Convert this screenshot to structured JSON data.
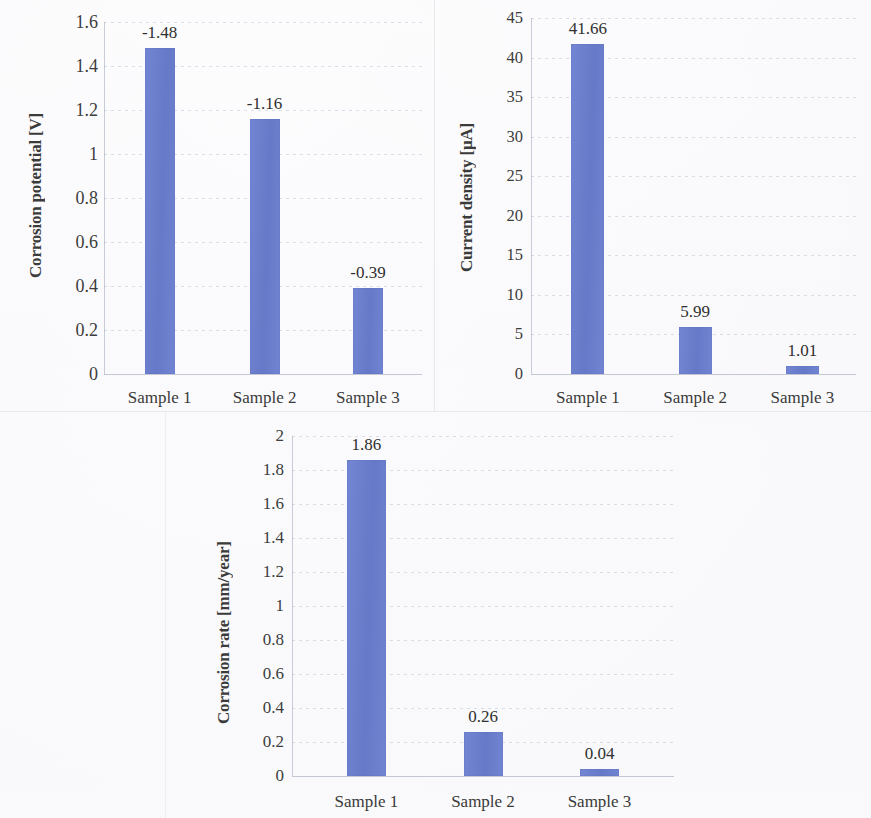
{
  "figure": {
    "charts": [
      {
        "id": "corrosion-potential",
        "ylabel": "Corrosion potential [V]",
        "categories": [
          "Sample 1",
          "Sample 2",
          "Sample 3"
        ],
        "bar_labels": [
          "-1.48",
          "-1.16",
          "-0.39"
        ],
        "tick_labels": [
          "1.6",
          "1.4",
          "1.2",
          "1",
          "0.8",
          "0.6",
          "0.4",
          "0.2",
          "0"
        ]
      },
      {
        "id": "current-density",
        "ylabel": "Current density [µA]",
        "categories": [
          "Sample 1",
          "Sample 2",
          "Sample 3"
        ],
        "bar_labels": [
          "41.66",
          "5.99",
          "1.01"
        ],
        "tick_labels": [
          "45",
          "40",
          "35",
          "30",
          "25",
          "20",
          "15",
          "10",
          "5",
          "0"
        ]
      },
      {
        "id": "corrosion-rate",
        "ylabel": "Corrosion rate [mm/year]",
        "categories": [
          "Sample 1",
          "Sample 2",
          "Sample 3"
        ],
        "bar_labels": [
          "1.86",
          "0.26",
          "0.04"
        ],
        "tick_labels": [
          "2",
          "1.8",
          "1.6",
          "1.4",
          "1.2",
          "1",
          "0.8",
          "0.6",
          "0.4",
          "0.2",
          "0"
        ]
      }
    ]
  },
  "colors": {
    "bar_fill": "#6a7ed0",
    "gridline": "#a8b0c4",
    "text": "#3a3a3a",
    "frame": "#e9e9ec"
  },
  "chart_data": [
    {
      "type": "bar",
      "title": "",
      "xlabel": "",
      "ylabel": "Corrosion potential [V]",
      "categories": [
        "Sample 1",
        "Sample 2",
        "Sample 3"
      ],
      "values": [
        1.48,
        1.16,
        0.39
      ],
      "data_labels": [
        "-1.48",
        "-1.16",
        "-0.39"
      ],
      "true_values": [
        -1.48,
        -1.16,
        -0.39
      ],
      "ylim": [
        0,
        1.6
      ],
      "ytick_step": 0.2,
      "yticks": [
        0,
        0.2,
        0.4,
        0.6,
        0.8,
        1,
        1.2,
        1.4,
        1.6
      ],
      "grid": true,
      "legend": false
    },
    {
      "type": "bar",
      "title": "",
      "xlabel": "",
      "ylabel": "Current density [µA]",
      "categories": [
        "Sample 1",
        "Sample 2",
        "Sample 3"
      ],
      "values": [
        41.66,
        5.99,
        1.01
      ],
      "data_labels": [
        "41.66",
        "5.99",
        "1.01"
      ],
      "ylim": [
        0,
        45
      ],
      "ytick_step": 5,
      "yticks": [
        0,
        5,
        10,
        15,
        20,
        25,
        30,
        35,
        40,
        45
      ],
      "grid": true,
      "legend": false
    },
    {
      "type": "bar",
      "title": "",
      "xlabel": "",
      "ylabel": "Corrosion rate [mm/year]",
      "categories": [
        "Sample 1",
        "Sample 2",
        "Sample 3"
      ],
      "values": [
        1.86,
        0.26,
        0.04
      ],
      "data_labels": [
        "1.86",
        "0.26",
        "0.04"
      ],
      "ylim": [
        0,
        2
      ],
      "ytick_step": 0.2,
      "yticks": [
        0,
        0.2,
        0.4,
        0.6,
        0.8,
        1,
        1.2,
        1.4,
        1.6,
        1.8,
        2
      ],
      "grid": true,
      "legend": false
    }
  ]
}
